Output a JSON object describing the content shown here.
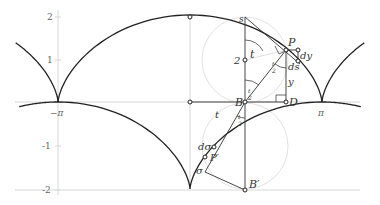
{
  "diagram": {
    "type": "cycloid-geometry",
    "axes": {
      "y_ticks": [
        "2",
        "1",
        "-1",
        "-2"
      ],
      "x_ticks": [
        "−π",
        "π"
      ]
    },
    "points": {
      "P": "P",
      "B": "B",
      "D": "D",
      "P_prime": "P′",
      "B_prime": "B′",
      "s": "s",
      "two": "2"
    },
    "labels": {
      "t_angle": "t",
      "t_segment": "t",
      "half_t_top": "t/2",
      "half_t_mid_num": "t",
      "half_t_den": "2",
      "ds": "ds",
      "dy": "dy",
      "y": "y",
      "dsigma": "dσ",
      "sigma": "σ"
    },
    "colors": {
      "curve": "#222222",
      "construction": "#333333",
      "axis": "#cccccc",
      "circle": "#dddddd"
    }
  }
}
